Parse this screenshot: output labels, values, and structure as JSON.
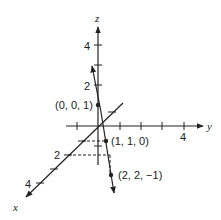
{
  "figure": {
    "type": "3d-coordinate-axes-with-line",
    "axes": {
      "x": {
        "label": "x",
        "ticks": [
          "2",
          "4"
        ]
      },
      "y": {
        "label": "y",
        "ticks": [
          "4"
        ]
      },
      "z": {
        "label": "z",
        "ticks": [
          "2",
          "4"
        ]
      }
    },
    "points": [
      {
        "label": "(0, 0, 1)",
        "coords": [
          0,
          0,
          1
        ]
      },
      {
        "label": "(1, 1, 0)",
        "coords": [
          1,
          1,
          0
        ]
      },
      {
        "label": "(2, 2, −1)",
        "coords": [
          2,
          2,
          -1
        ]
      }
    ],
    "colors": {
      "ink": "#222222",
      "background": "#ffffff"
    }
  }
}
